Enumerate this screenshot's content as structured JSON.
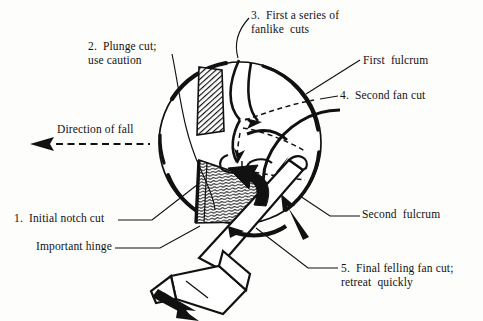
{
  "figure": {
    "background_color": "#fdfdfc",
    "ink_color": "#111111"
  },
  "labels": {
    "fanlike_cuts": {
      "line1": "3.  First a series of",
      "line2": "fanlike  cuts"
    },
    "plunge_cut": {
      "line1": "2.  Plunge cut;",
      "line2": "use caution"
    },
    "first_fulcrum": {
      "line1": "First  fulcrum"
    },
    "second_fan_cut": {
      "line1": "4.  Second fan cut"
    },
    "direction_of_fall": {
      "line1": "Direction of fall"
    },
    "initial_notch_cut": {
      "line1": "1.  Initial notch cut"
    },
    "important_hinge": {
      "line1": "Important hinge"
    },
    "second_fulcrum": {
      "line1": "Second  fulcrum"
    },
    "final_felling_fan_cut": {
      "line1": "5.  Final felling fan cut;",
      "line2": "retreat  quickly"
    }
  },
  "diagram_parts": {
    "trunk_circle": "tree-trunk-cross-section",
    "upper_hatched_block": "upper-notch-face-cross-hatched",
    "lower_hatched_wedge": "hinge-wood-wedge-grain-hatched",
    "chainsaw": "chainsaw-bar-and-body",
    "cut_direction_arrow": "thick-black-cut-direction-arrow",
    "fall_arrow": "dashed-direction-of-fall-arrow",
    "fan_cut_lines": "dashed-fan-cut-paths",
    "retreat_arrow": "retreat-direction-arrow"
  }
}
